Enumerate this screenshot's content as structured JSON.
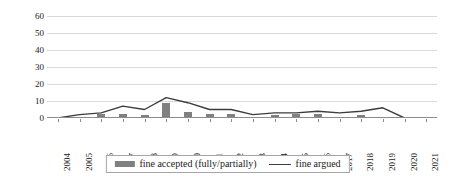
{
  "chart_data": {
    "type": "bar",
    "title": "",
    "subtitle": "",
    "xlabel": "",
    "ylabel": "",
    "ylim": [
      0,
      60
    ],
    "yticks": [
      0,
      10,
      20,
      30,
      40,
      50,
      60
    ],
    "grid": true,
    "legend_position": "bottom",
    "categories": [
      "2004",
      "2005",
      "2006",
      "2007",
      "2008",
      "2009",
      "2010",
      "2011",
      "2012",
      "2013",
      "2014",
      "2015",
      "2016",
      "2017",
      "2018",
      "2019",
      "2020",
      "2021"
    ],
    "series": [
      {
        "name": "fine accepted (fully/partially)",
        "type": "bar",
        "color": "#808080",
        "values": [
          0,
          0,
          2,
          2,
          1,
          8,
          3,
          2,
          2,
          0,
          1,
          2,
          2,
          0,
          1,
          0,
          0,
          0
        ]
      },
      {
        "name": "fine argued",
        "type": "line",
        "color": "#3d3d3d",
        "values": [
          0,
          2,
          3,
          7,
          5,
          12,
          9,
          5,
          5,
          2,
          3,
          3,
          4,
          3,
          4,
          6,
          0,
          0
        ]
      }
    ]
  },
  "legend": {
    "items": [
      {
        "label": "fine accepted (fully/partially)",
        "marker": "bar-swatch"
      },
      {
        "label": "fine argued",
        "marker": "line-swatch"
      }
    ]
  }
}
